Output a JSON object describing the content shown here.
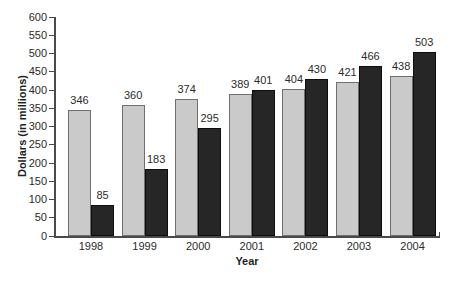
{
  "chart_data": {
    "type": "bar",
    "title": "",
    "xlabel": "Year",
    "ylabel": "Dollars (in millions)",
    "categories": [
      "1998",
      "1999",
      "2000",
      "2001",
      "2002",
      "2003",
      "2004"
    ],
    "series": [
      {
        "name": "light-gray-bars",
        "color": "#cacaca",
        "border_color": "#6f6f6f",
        "values": [
          346,
          360,
          374,
          389,
          404,
          421,
          438
        ]
      },
      {
        "name": "dark-bars",
        "color": "#262626",
        "border_color": "#0d0d0d",
        "values": [
          85,
          183,
          295,
          401,
          430,
          466,
          503
        ]
      }
    ],
    "ylim": [
      0,
      600
    ],
    "yticks": [
      0,
      50,
      100,
      150,
      200,
      250,
      300,
      350,
      400,
      450,
      500,
      550,
      600
    ],
    "value_labels_shown": true,
    "grid": "off",
    "legend": "none",
    "colors": {
      "axis": "#4a4a4a",
      "text": "#2b2b2b",
      "background": "#ffffff"
    }
  }
}
